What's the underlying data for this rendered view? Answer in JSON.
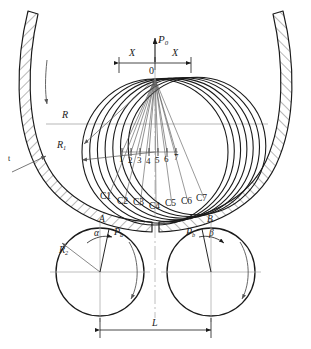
{
  "diagram": {
    "colors": {
      "line": "#1a1a1a",
      "thin": "#555555",
      "center": "#9a9a9a",
      "hatch": "#333333",
      "background": "#ffffff"
    },
    "labels": {
      "p0": "P",
      "p0_sub": "0",
      "origin": "0",
      "x_left": "X",
      "x_right": "X",
      "radius_outer": "R",
      "radius_inner": "R",
      "radius_inner_sub": "1",
      "roller_radius": "R",
      "roller_radius_sub": "2",
      "span": "L",
      "point_a": "A",
      "point_b": "B",
      "angle_alpha": "α",
      "angle_beta": "β",
      "force_a": "P",
      "force_a_sub": "a",
      "force_b": "P",
      "force_b_sub": "b",
      "thickness": "t"
    },
    "station_numbers": [
      "1",
      "2",
      "3",
      "4",
      "5",
      "6",
      "7"
    ],
    "center_labels": [
      "C1",
      "C2",
      "C3",
      "C4",
      "C5",
      "C6",
      "C7"
    ]
  }
}
